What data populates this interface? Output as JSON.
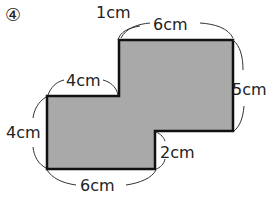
{
  "problem": {
    "number": "④"
  },
  "shape": {
    "type": "composite-rectangle",
    "fill": "#a9a9a9",
    "stroke": "#111111"
  },
  "dimensions": {
    "top_offset": "1cm",
    "top_width": "6cm",
    "right_height": "5cm",
    "step_width": "4cm",
    "left_height": "4cm",
    "notch_height": "2cm",
    "bottom_width": "6cm"
  }
}
